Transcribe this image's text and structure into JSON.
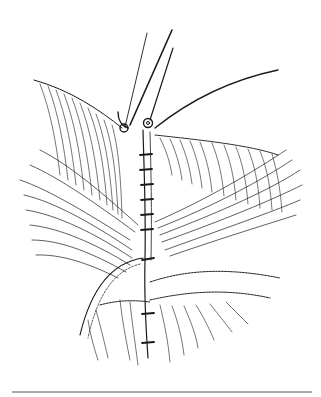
{
  "figure": {
    "background_color": "#ffffff",
    "ink_color": "#1a1a1a",
    "rule_color": "#555555",
    "caption": ""
  }
}
